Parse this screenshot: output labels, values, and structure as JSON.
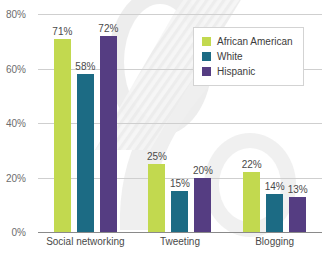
{
  "chart_data": {
    "type": "bar",
    "title": "",
    "xlabel": "",
    "ylabel": "",
    "categories": [
      "Social networking",
      "Tweeting",
      "Blogging"
    ],
    "series": [
      {
        "name": "African American",
        "color": "#c2d94f",
        "values": [
          71,
          58,
          72
        ]
      },
      {
        "name": "White",
        "color": "#1c6b84",
        "values": [
          25,
          15,
          20
        ]
      },
      {
        "name": "Hispanic",
        "color": "#553d82",
        "values": [
          22,
          14,
          13
        ]
      }
    ],
    "groups": [
      {
        "category": "Social networking",
        "bars": [
          {
            "series": "African American",
            "value": 71,
            "label": "71%",
            "color": "#c2d94f"
          },
          {
            "series": "White",
            "value": 58,
            "label": "58%",
            "color": "#1c6b84"
          },
          {
            "series": "Hispanic",
            "value": 72,
            "label": "72%",
            "color": "#553d82"
          }
        ]
      },
      {
        "category": "Tweeting",
        "bars": [
          {
            "series": "African American",
            "value": 25,
            "label": "25%",
            "color": "#c2d94f"
          },
          {
            "series": "White",
            "value": 15,
            "label": "15%",
            "color": "#1c6b84"
          },
          {
            "series": "Hispanic",
            "value": 20,
            "label": "20%",
            "color": "#553d82"
          }
        ]
      },
      {
        "category": "Blogging",
        "bars": [
          {
            "series": "African American",
            "value": 22,
            "label": "22%",
            "color": "#c2d94f"
          },
          {
            "series": "White",
            "value": 14,
            "label": "14%",
            "color": "#1c6b84"
          },
          {
            "series": "Hispanic",
            "value": 13,
            "label": "13%",
            "color": "#553d82"
          }
        ]
      }
    ],
    "ylim": [
      0,
      80
    ],
    "yticks": [
      0,
      20,
      40,
      60,
      80
    ],
    "ytick_labels": [
      "0%",
      "20%",
      "40%",
      "60%",
      "80%"
    ],
    "grid": true,
    "legend_position": "top-right",
    "legend_entries": [
      {
        "label": "African American",
        "color": "#c2d94f"
      },
      {
        "label": "White",
        "color": "#1c6b84"
      },
      {
        "label": "Hispanic",
        "color": "#553d82"
      }
    ]
  }
}
